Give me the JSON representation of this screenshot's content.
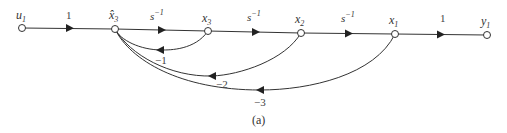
{
  "diagram": {
    "type": "signal-flow-graph",
    "caption": "(a)",
    "nodes": [
      {
        "id": "u1",
        "base": "u",
        "sub": "1"
      },
      {
        "id": "x3hat",
        "base": "x̂",
        "sub": "3"
      },
      {
        "id": "x3",
        "base": "x",
        "sub": "3"
      },
      {
        "id": "x2",
        "base": "x",
        "sub": "2"
      },
      {
        "id": "x1",
        "base": "x",
        "sub": "1"
      },
      {
        "id": "y1",
        "base": "y",
        "sub": "1"
      }
    ],
    "forward_gains": [
      {
        "from": "u1",
        "to": "x3hat",
        "gain": "1"
      },
      {
        "from": "x3hat",
        "to": "x3",
        "gain_base": "s",
        "gain_exp": "−1"
      },
      {
        "from": "x3",
        "to": "x2",
        "gain_base": "s",
        "gain_exp": "−1"
      },
      {
        "from": "x2",
        "to": "x1",
        "gain_base": "s",
        "gain_exp": "−1"
      },
      {
        "from": "x1",
        "to": "y1",
        "gain": "1"
      }
    ],
    "feedback_gains": [
      {
        "from": "x3",
        "to": "x3hat",
        "gain": "−1"
      },
      {
        "from": "x2",
        "to": "x3hat",
        "gain": "−2"
      },
      {
        "from": "x1",
        "to": "x3hat",
        "gain": "−3"
      }
    ]
  }
}
